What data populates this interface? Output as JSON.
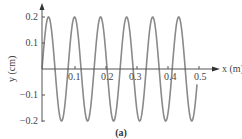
{
  "chart_data": {
    "type": "line",
    "title": "",
    "caption": "(a)",
    "xlabel": "x (m)",
    "ylabel": "y (cm)",
    "xlim": [
      0,
      0.5
    ],
    "ylim": [
      -0.2,
      0.2
    ],
    "x_ticks": [
      "0.1",
      "0.2",
      "0.3",
      "0.4",
      "0.5"
    ],
    "y_ticks": [
      "0.2",
      "0.1",
      "-0.1",
      "-0.2"
    ],
    "grid": false,
    "series": [
      {
        "name": "transverse wave",
        "function": "y = 0.2 sin(2πx/λ)",
        "amplitude_cm": 0.2,
        "wavelength_m": 0.084,
        "cycles_shown": 6,
        "color": "#8a8a8a"
      }
    ]
  },
  "labels": {
    "xaxis": "x (m)",
    "yaxis": "y (cm)",
    "caption": "(a)",
    "xticks": [
      "0.1",
      "0.2",
      "0.3",
      "0.4",
      "0.5"
    ],
    "yticks": [
      "0.2",
      "0.1",
      "−0.1",
      "−0.2"
    ]
  },
  "colors": {
    "curve": "#8a8a8a",
    "axis": "#555555"
  }
}
